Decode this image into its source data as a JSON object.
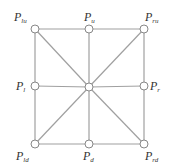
{
  "diagram": {
    "line_color": "#a0a0a0",
    "node_stroke": "#888888",
    "node_radius": 4,
    "nodes": [
      {
        "id": "lu",
        "x": 35,
        "y": 29,
        "label": "P",
        "sub": "lu",
        "lx": 14,
        "ly": 21
      },
      {
        "id": "u",
        "x": 89,
        "y": 29,
        "label": "P",
        "sub": "u",
        "lx": 84,
        "ly": 21
      },
      {
        "id": "ru",
        "x": 144,
        "y": 29,
        "label": "P",
        "sub": "ru",
        "lx": 145,
        "ly": 21
      },
      {
        "id": "l",
        "x": 35,
        "y": 86,
        "label": "P",
        "sub": "l",
        "lx": 16,
        "ly": 90
      },
      {
        "id": "c",
        "x": 89,
        "y": 87,
        "label": "",
        "sub": "",
        "lx": 0,
        "ly": 0
      },
      {
        "id": "r",
        "x": 144,
        "y": 86,
        "label": "P",
        "sub": "r",
        "lx": 150,
        "ly": 90
      },
      {
        "id": "ld",
        "x": 35,
        "y": 144,
        "label": "P",
        "sub": "ld",
        "lx": 16,
        "ly": 160
      },
      {
        "id": "d",
        "x": 89,
        "y": 144,
        "label": "P",
        "sub": "d",
        "lx": 83,
        "ly": 160
      },
      {
        "id": "rd",
        "x": 144,
        "y": 144,
        "label": "P",
        "sub": "rd",
        "lx": 145,
        "ly": 160
      }
    ],
    "edges": [
      [
        "lu",
        "u"
      ],
      [
        "u",
        "ru"
      ],
      [
        "ld",
        "d"
      ],
      [
        "d",
        "rd"
      ],
      [
        "lu",
        "l"
      ],
      [
        "l",
        "ld"
      ],
      [
        "ru",
        "r"
      ],
      [
        "r",
        "rd"
      ],
      [
        "u",
        "c"
      ],
      [
        "c",
        "d"
      ],
      [
        "l",
        "c"
      ],
      [
        "c",
        "r"
      ],
      [
        "lu",
        "c"
      ],
      [
        "c",
        "rd"
      ],
      [
        "ru",
        "c"
      ],
      [
        "c",
        "ld"
      ]
    ]
  }
}
